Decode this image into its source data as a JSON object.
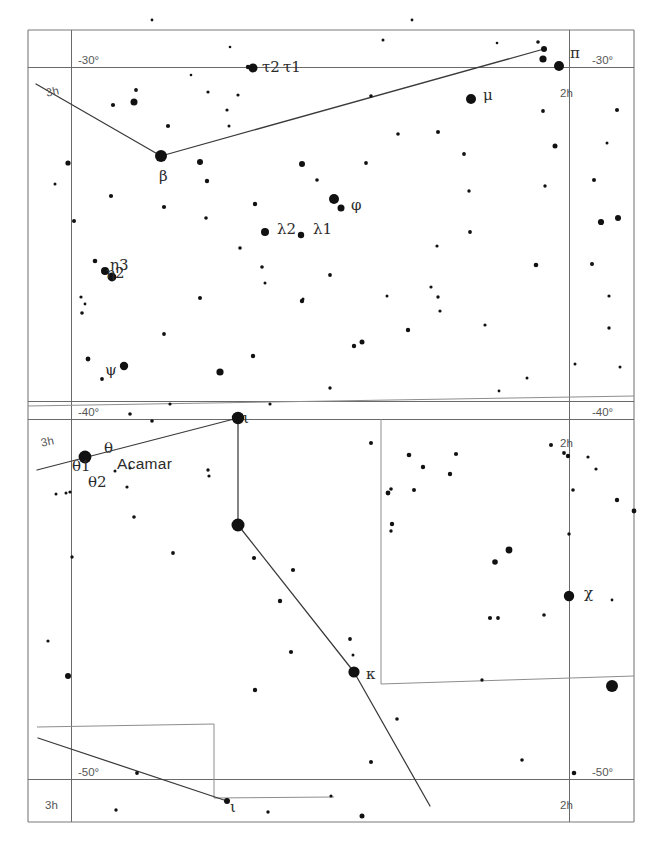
{
  "chart": {
    "type": "star-chart",
    "width": 656,
    "height": 852,
    "background_color": "#ffffff",
    "star_color": "#111111",
    "grid_color": "#6a6a6a",
    "line_color": "#3a3a3a"
  },
  "coordinate_labels": [
    {
      "text": "-30°",
      "x": 78,
      "y": 55,
      "name": "dec-minus-30-left"
    },
    {
      "text": "-30°",
      "x": 592,
      "y": 55,
      "name": "dec-minus-30-right"
    },
    {
      "text": "-40°",
      "x": 78,
      "y": 407,
      "name": "dec-minus-40-left"
    },
    {
      "text": "-40°",
      "x": 592,
      "y": 407,
      "name": "dec-minus-40-right"
    },
    {
      "text": "-50°",
      "x": 78,
      "y": 767,
      "name": "dec-minus-50-left"
    },
    {
      "text": "-50°",
      "x": 592,
      "y": 767,
      "name": "dec-minus-50-right"
    },
    {
      "text": "3h",
      "x": 45,
      "y": 88,
      "name": "ra-3h-top-left",
      "rotate": -12
    },
    {
      "text": "2h",
      "x": 560,
      "y": 88,
      "name": "ra-2h-top-right"
    },
    {
      "text": "3h",
      "x": 40,
      "y": 438,
      "name": "ra-3h-mid-left",
      "rotate": -12
    },
    {
      "text": "2h",
      "x": 560,
      "y": 438,
      "name": "ra-2h-mid-right"
    },
    {
      "text": "3h",
      "x": 45,
      "y": 800,
      "name": "ra-3h-bottom-left"
    },
    {
      "text": "2h",
      "x": 560,
      "y": 800,
      "name": "ra-2h-bottom-right"
    }
  ],
  "star_labels": [
    {
      "text": "τ2",
      "x": 262,
      "y": 60,
      "name": "label-tau2"
    },
    {
      "text": "τ1",
      "x": 283,
      "y": 60,
      "name": "label-tau1"
    },
    {
      "text": "π",
      "x": 570,
      "y": 46,
      "name": "label-pi"
    },
    {
      "text": "μ",
      "x": 483,
      "y": 88,
      "name": "label-mu"
    },
    {
      "text": "β",
      "x": 159,
      "y": 169,
      "name": "label-beta"
    },
    {
      "text": "φ",
      "x": 351,
      "y": 198,
      "name": "label-phi"
    },
    {
      "text": "λ2",
      "x": 277,
      "y": 222,
      "name": "label-lambda2"
    },
    {
      "text": "λ1",
      "x": 313,
      "y": 222,
      "name": "label-lambda1"
    },
    {
      "text": "η3",
      "x": 110,
      "y": 258,
      "name": "label-eta3"
    },
    {
      "text": "η2",
      "x": 106,
      "y": 266,
      "name": "label-eta2"
    },
    {
      "text": "ψ",
      "x": 105,
      "y": 363,
      "name": "label-psi"
    },
    {
      "text": "ι",
      "x": 243,
      "y": 411,
      "name": "label-iota-upper"
    },
    {
      "text": "θ",
      "x": 104,
      "y": 441,
      "name": "label-theta"
    },
    {
      "text": "θ1",
      "x": 72,
      "y": 459,
      "name": "label-theta1"
    },
    {
      "text": "θ2",
      "x": 88,
      "y": 475,
      "name": "label-theta2"
    },
    {
      "text": "Acamar",
      "x": 117,
      "y": 456,
      "name": "label-acamar",
      "style": "named"
    },
    {
      "text": "χ",
      "x": 584,
      "y": 586,
      "name": "label-chi"
    },
    {
      "text": "κ",
      "x": 366,
      "y": 667,
      "name": "label-kappa"
    },
    {
      "text": "ι",
      "x": 230,
      "y": 800,
      "name": "label-iota-lower"
    }
  ],
  "grid_geometry": {
    "dec_lines": [
      {
        "name": "dec-minus-30",
        "d": "M 28 67 L 634 67"
      },
      {
        "name": "dec-minus-40",
        "d": "M 28 401 L 634 401"
      },
      {
        "name": "dec-minus-40b",
        "d": "M 28 419 L 634 419"
      },
      {
        "name": "dec-minus-50",
        "d": "M 28 779 L 634 779"
      }
    ],
    "ra_lines": [
      {
        "name": "ra-3h",
        "d": "M 71 30 L 71 822"
      },
      {
        "name": "ra-2h",
        "d": "M 569 30 L 569 822"
      }
    ],
    "frame": [
      {
        "name": "frame-left",
        "d": "M 28 30 L 28 822"
      },
      {
        "name": "frame-right",
        "d": "M 634 30 L 634 822"
      },
      {
        "name": "frame-top",
        "d": "M 28 30 L 634 30"
      },
      {
        "name": "frame-bottom",
        "d": "M 28 822 L 634 822"
      }
    ]
  },
  "constellation_boundaries": [
    {
      "name": "boundary-upper",
      "d": "M 28 406 L 634 396"
    },
    {
      "name": "boundary-vertical-mid",
      "d": "M 381 419 L 381 684"
    },
    {
      "name": "boundary-lower-step",
      "d": "M 381 684 L 634 676"
    },
    {
      "name": "boundary-lower-left",
      "d": "M 37 727 L 214 724 L 214 798 L 334 797"
    }
  ],
  "constellation_lines": [
    {
      "name": "eridanus-chain-top",
      "d": "M 36 84 L 161 156 L 544 49"
    },
    {
      "name": "eridanus-chain-middle",
      "d": "M 37 470 L 238 418 L 238 525 L 354 672 L 430 806"
    },
    {
      "name": "eridanus-chain-lower",
      "d": "M 38 738 L 227 801"
    }
  ],
  "stars": [
    {
      "x": 161,
      "y": 156,
      "r": 6.0
    },
    {
      "x": 559,
      "y": 66,
      "r": 5.0
    },
    {
      "x": 253,
      "y": 68,
      "r": 4.5
    },
    {
      "x": 471,
      "y": 99,
      "r": 5.0
    },
    {
      "x": 544,
      "y": 49,
      "r": 3.0
    },
    {
      "x": 543,
      "y": 59,
      "r": 3.6
    },
    {
      "x": 538,
      "y": 42,
      "r": 1.8
    },
    {
      "x": 334,
      "y": 199,
      "r": 5.0
    },
    {
      "x": 301,
      "y": 235,
      "r": 3.2
    },
    {
      "x": 265,
      "y": 232,
      "r": 4.0
    },
    {
      "x": 112,
      "y": 277,
      "r": 4.4
    },
    {
      "x": 105,
      "y": 271,
      "r": 4.0
    },
    {
      "x": 124,
      "y": 366,
      "r": 4.2
    },
    {
      "x": 238,
      "y": 418,
      "r": 6.2
    },
    {
      "x": 85,
      "y": 457,
      "r": 6.4
    },
    {
      "x": 238,
      "y": 525,
      "r": 6.5
    },
    {
      "x": 354,
      "y": 672,
      "r": 5.6
    },
    {
      "x": 569,
      "y": 596,
      "r": 5.2
    },
    {
      "x": 612,
      "y": 686,
      "r": 6.0
    },
    {
      "x": 248,
      "y": 67,
      "r": 2.2
    },
    {
      "x": 238,
      "y": 95,
      "r": 1.6
    },
    {
      "x": 208,
      "y": 92,
      "r": 1.6
    },
    {
      "x": 152,
      "y": 20,
      "r": 1.4
    },
    {
      "x": 136,
      "y": 90,
      "r": 1.9
    },
    {
      "x": 134,
      "y": 102,
      "r": 3.5
    },
    {
      "x": 113,
      "y": 105,
      "r": 2.1
    },
    {
      "x": 168,
      "y": 126,
      "r": 2.1
    },
    {
      "x": 227,
      "y": 110,
      "r": 1.6
    },
    {
      "x": 229,
      "y": 126,
      "r": 1.5
    },
    {
      "x": 191,
      "y": 75,
      "r": 1.3
    },
    {
      "x": 68,
      "y": 163,
      "r": 2.6
    },
    {
      "x": 55,
      "y": 184,
      "r": 1.5
    },
    {
      "x": 111,
      "y": 196,
      "r": 2.1
    },
    {
      "x": 164,
      "y": 207,
      "r": 2.1
    },
    {
      "x": 200,
      "y": 162,
      "r": 3.0
    },
    {
      "x": 207,
      "y": 181,
      "r": 2.2
    },
    {
      "x": 74,
      "y": 221,
      "r": 2.0
    },
    {
      "x": 255,
      "y": 204,
      "r": 2.2
    },
    {
      "x": 206,
      "y": 218,
      "r": 1.8
    },
    {
      "x": 302,
      "y": 164,
      "r": 3.0
    },
    {
      "x": 317,
      "y": 180,
      "r": 1.8
    },
    {
      "x": 341,
      "y": 208,
      "r": 3.5
    },
    {
      "x": 240,
      "y": 248,
      "r": 1.8
    },
    {
      "x": 262,
      "y": 267,
      "r": 1.8
    },
    {
      "x": 265,
      "y": 283,
      "r": 1.5
    },
    {
      "x": 95,
      "y": 261,
      "r": 2.3
    },
    {
      "x": 81,
      "y": 297,
      "r": 1.6
    },
    {
      "x": 85,
      "y": 304,
      "r": 1.4
    },
    {
      "x": 82,
      "y": 313,
      "r": 1.8
    },
    {
      "x": 200,
      "y": 298,
      "r": 2.0
    },
    {
      "x": 302,
      "y": 301,
      "r": 2.2
    },
    {
      "x": 164,
      "y": 334,
      "r": 1.9
    },
    {
      "x": 88,
      "y": 359,
      "r": 2.4
    },
    {
      "x": 102,
      "y": 379,
      "r": 1.9
    },
    {
      "x": 253,
      "y": 356,
      "r": 2.2
    },
    {
      "x": 220,
      "y": 372,
      "r": 3.6
    },
    {
      "x": 303,
      "y": 299,
      "r": 1.5
    },
    {
      "x": 366,
      "y": 163,
      "r": 1.9
    },
    {
      "x": 398,
      "y": 134,
      "r": 1.8
    },
    {
      "x": 371,
      "y": 96,
      "r": 1.8
    },
    {
      "x": 438,
      "y": 132,
      "r": 2.0
    },
    {
      "x": 464,
      "y": 154,
      "r": 1.9
    },
    {
      "x": 469,
      "y": 191,
      "r": 1.7
    },
    {
      "x": 470,
      "y": 232,
      "r": 1.9
    },
    {
      "x": 437,
      "y": 246,
      "r": 1.6
    },
    {
      "x": 431,
      "y": 287,
      "r": 1.6
    },
    {
      "x": 438,
      "y": 297,
      "r": 1.7
    },
    {
      "x": 440,
      "y": 311,
      "r": 1.6
    },
    {
      "x": 485,
      "y": 325,
      "r": 1.6
    },
    {
      "x": 387,
      "y": 296,
      "r": 1.5
    },
    {
      "x": 408,
      "y": 330,
      "r": 2.2
    },
    {
      "x": 354,
      "y": 346,
      "r": 2.2
    },
    {
      "x": 362,
      "y": 342,
      "r": 2.5
    },
    {
      "x": 543,
      "y": 111,
      "r": 1.9
    },
    {
      "x": 555,
      "y": 146,
      "r": 2.5
    },
    {
      "x": 594,
      "y": 180,
      "r": 2.0
    },
    {
      "x": 545,
      "y": 186,
      "r": 1.7
    },
    {
      "x": 592,
      "y": 264,
      "r": 2.0
    },
    {
      "x": 536,
      "y": 265,
      "r": 2.3
    },
    {
      "x": 330,
      "y": 275,
      "r": 1.9
    },
    {
      "x": 601,
      "y": 222,
      "r": 3.1
    },
    {
      "x": 618,
      "y": 218,
      "r": 3.0
    },
    {
      "x": 617,
      "y": 110,
      "r": 2.0
    },
    {
      "x": 609,
      "y": 296,
      "r": 1.6
    },
    {
      "x": 609,
      "y": 328,
      "r": 1.7
    },
    {
      "x": 575,
      "y": 364,
      "r": 1.5
    },
    {
      "x": 527,
      "y": 378,
      "r": 1.5
    },
    {
      "x": 499,
      "y": 391,
      "r": 1.4
    },
    {
      "x": 330,
      "y": 388,
      "r": 1.7
    },
    {
      "x": 270,
      "y": 404,
      "r": 1.6
    },
    {
      "x": 152,
      "y": 421,
      "r": 1.8
    },
    {
      "x": 170,
      "y": 404,
      "r": 1.6
    },
    {
      "x": 130,
      "y": 414,
      "r": 1.8
    },
    {
      "x": 115,
      "y": 471,
      "r": 1.5
    },
    {
      "x": 130,
      "y": 468,
      "r": 1.5
    },
    {
      "x": 127,
      "y": 487,
      "r": 1.6
    },
    {
      "x": 70,
      "y": 492,
      "r": 1.6
    },
    {
      "x": 66,
      "y": 493,
      "r": 1.5
    },
    {
      "x": 56,
      "y": 494,
      "r": 1.5
    },
    {
      "x": 208,
      "y": 470,
      "r": 1.7
    },
    {
      "x": 209,
      "y": 476,
      "r": 1.6
    },
    {
      "x": 371,
      "y": 443,
      "r": 2.0
    },
    {
      "x": 409,
      "y": 455,
      "r": 2.3
    },
    {
      "x": 456,
      "y": 454,
      "r": 2.1
    },
    {
      "x": 423,
      "y": 467,
      "r": 2.2
    },
    {
      "x": 551,
      "y": 445,
      "r": 2.0
    },
    {
      "x": 564,
      "y": 453,
      "r": 1.9
    },
    {
      "x": 588,
      "y": 457,
      "r": 1.6
    },
    {
      "x": 596,
      "y": 469,
      "r": 1.6
    },
    {
      "x": 573,
      "y": 490,
      "r": 1.8
    },
    {
      "x": 617,
      "y": 500,
      "r": 2.2
    },
    {
      "x": 569,
      "y": 534,
      "r": 1.7
    },
    {
      "x": 414,
      "y": 490,
      "r": 2.0
    },
    {
      "x": 388,
      "y": 493,
      "r": 2.4
    },
    {
      "x": 391,
      "y": 489,
      "r": 1.8
    },
    {
      "x": 450,
      "y": 474,
      "r": 2.2
    },
    {
      "x": 392,
      "y": 524,
      "r": 2.2
    },
    {
      "x": 391,
      "y": 531,
      "r": 1.7
    },
    {
      "x": 509,
      "y": 550,
      "r": 3.4
    },
    {
      "x": 495,
      "y": 562,
      "r": 2.8
    },
    {
      "x": 490,
      "y": 618,
      "r": 2.1
    },
    {
      "x": 498,
      "y": 618,
      "r": 1.9
    },
    {
      "x": 544,
      "y": 615,
      "r": 1.8
    },
    {
      "x": 482,
      "y": 680,
      "r": 1.7
    },
    {
      "x": 350,
      "y": 639,
      "r": 1.9
    },
    {
      "x": 397,
      "y": 719,
      "r": 1.8
    },
    {
      "x": 371,
      "y": 762,
      "r": 2.0
    },
    {
      "x": 331,
      "y": 796,
      "r": 1.6
    },
    {
      "x": 362,
      "y": 816,
      "r": 2.5
    },
    {
      "x": 522,
      "y": 760,
      "r": 1.8
    },
    {
      "x": 353,
      "y": 655,
      "r": 1.5
    },
    {
      "x": 293,
      "y": 570,
      "r": 2.1
    },
    {
      "x": 254,
      "y": 558,
      "r": 2.1
    },
    {
      "x": 280,
      "y": 601,
      "r": 2.2
    },
    {
      "x": 291,
      "y": 652,
      "r": 2.1
    },
    {
      "x": 255,
      "y": 690,
      "r": 2.2
    },
    {
      "x": 173,
      "y": 553,
      "r": 1.9
    },
    {
      "x": 134,
      "y": 517,
      "r": 1.8
    },
    {
      "x": 72,
      "y": 557,
      "r": 1.7
    },
    {
      "x": 68,
      "y": 676,
      "r": 3.0
    },
    {
      "x": 48,
      "y": 641,
      "r": 1.6
    },
    {
      "x": 227,
      "y": 801,
      "r": 3.0
    },
    {
      "x": 137,
      "y": 773,
      "r": 1.9
    },
    {
      "x": 116,
      "y": 810,
      "r": 1.7
    },
    {
      "x": 268,
      "y": 812,
      "r": 1.7
    },
    {
      "x": 568,
      "y": 456,
      "r": 2.2
    },
    {
      "x": 574,
      "y": 773,
      "r": 2.3
    },
    {
      "x": 634,
      "y": 511,
      "r": 2.4
    },
    {
      "x": 230,
      "y": 47,
      "r": 1.3
    },
    {
      "x": 383,
      "y": 40,
      "r": 1.5
    },
    {
      "x": 412,
      "y": 20,
      "r": 1.4
    },
    {
      "x": 497,
      "y": 43,
      "r": 1.3
    },
    {
      "x": 607,
      "y": 143,
      "r": 1.5
    },
    {
      "x": 620,
      "y": 367,
      "r": 1.5
    },
    {
      "x": 612,
      "y": 600,
      "r": 1.4
    }
  ]
}
